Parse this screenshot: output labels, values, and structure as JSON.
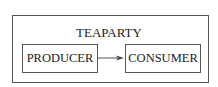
{
  "diagram": {
    "container": {
      "label": "TEAPARTY"
    },
    "nodes": [
      {
        "id": "producer",
        "label": "PRODUCER"
      },
      {
        "id": "consumer",
        "label": "CONSUMER"
      }
    ],
    "edges": [
      {
        "from": "producer",
        "to": "consumer",
        "type": "directed-arrow"
      }
    ],
    "colors": {
      "stroke": "#555555",
      "text": "#222222",
      "background": "#ffffff"
    }
  }
}
